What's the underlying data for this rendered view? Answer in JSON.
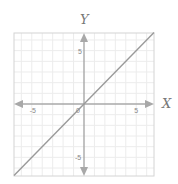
{
  "chart_data": {
    "type": "line",
    "title": "",
    "xlabel": "X",
    "ylabel": "Y",
    "xlim": [
      -6.7,
      6.7
    ],
    "ylim": [
      -6.7,
      6.7
    ],
    "grid": true,
    "grid_step": 1,
    "x_ticks": [
      {
        "value": -5,
        "label": "-5"
      },
      {
        "value": 0,
        "label": "0"
      },
      {
        "value": 5,
        "label": "5"
      }
    ],
    "y_ticks": [
      {
        "value": 5,
        "label": "5"
      },
      {
        "value": -5,
        "label": "-5"
      }
    ],
    "series": [
      {
        "name": "y = x",
        "x": [
          -6.7,
          6.7
        ],
        "y": [
          -6.7,
          6.7
        ],
        "color": "#9a9a9a"
      }
    ],
    "axes_arrows": true,
    "legend": null
  },
  "colors": {
    "axis": "#a8a8a8",
    "grid": "#ececec",
    "frame": "#d4d4d4",
    "line": "#9a9a9a"
  }
}
